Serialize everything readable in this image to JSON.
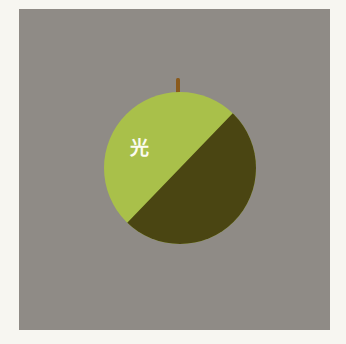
{
  "illustration": {
    "subject": "fruit split into light and shadow halves",
    "label": "光",
    "colors": {
      "page_background": "#f7f6f1",
      "panel_background": "#8f8b86",
      "light_half": "#a9c04a",
      "dark_half": "#4a4512",
      "stem": "#8a5a1c",
      "label_text": "#fbfbf0"
    }
  }
}
